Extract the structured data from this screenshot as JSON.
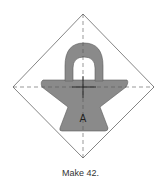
{
  "diagram": {
    "type": "quilt-block-template",
    "shape": "basket",
    "piece_label": "A",
    "caption": "Make 42.",
    "colors": {
      "outline": "#666666",
      "fill": "#8a8a8a",
      "fill_stroke": "#5a5a5a",
      "guide": "#555555",
      "crosshair": "#222222",
      "background": "#ffffff"
    }
  }
}
